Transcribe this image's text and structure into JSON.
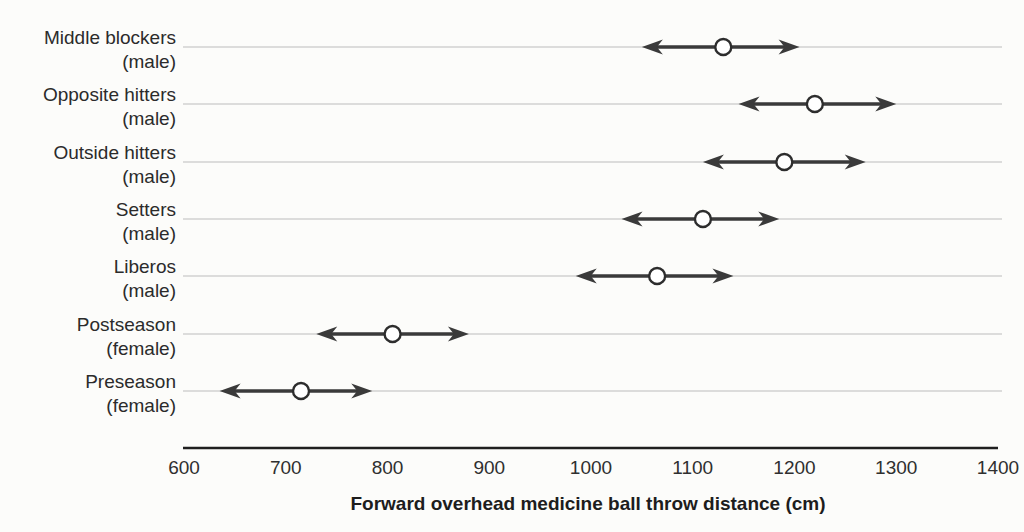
{
  "figure": {
    "background": "#fcfcfa"
  },
  "chart_data": {
    "type": "scatter",
    "subtype": "dot-with-range-arrows",
    "orientation": "horizontal",
    "title": "",
    "xlabel": "Forward overhead medicine ball throw distance (cm)",
    "ylabel": "",
    "xlim": [
      600,
      1400
    ],
    "xticks": [
      "600",
      "700",
      "800",
      "900",
      "1000",
      "1100",
      "1200",
      "1300",
      "1400"
    ],
    "grid": "faint horizontal line per category",
    "marker": "open circle at mean with left/right arrowheads at range ends",
    "legend": "none",
    "categories": [
      {
        "label": "Middle blockers",
        "sublabel": "(male)",
        "low": 1050,
        "value": 1130,
        "high": 1205
      },
      {
        "label": "Opposite hitters",
        "sublabel": "(male)",
        "low": 1145,
        "value": 1220,
        "high": 1300
      },
      {
        "label": "Outside hitters",
        "sublabel": "(male)",
        "low": 1110,
        "value": 1190,
        "high": 1270
      },
      {
        "label": "Setters",
        "sublabel": "(male)",
        "low": 1030,
        "value": 1110,
        "high": 1185
      },
      {
        "label": "Liberos",
        "sublabel": "(male)",
        "low": 985,
        "value": 1065,
        "high": 1140
      },
      {
        "label": "Postseason",
        "sublabel": "(female)",
        "low": 730,
        "value": 805,
        "high": 880
      },
      {
        "label": "Preseason",
        "sublabel": "(female)",
        "low": 635,
        "value": 715,
        "high": 785
      }
    ],
    "colors": {
      "arrow": "#3a3a3a",
      "marker_fill": "#ffffff",
      "marker_stroke": "#2d2d2d",
      "gridline": "#bcbcbc",
      "axis": "#1f1f1f",
      "text": "#2b2b2b"
    }
  }
}
